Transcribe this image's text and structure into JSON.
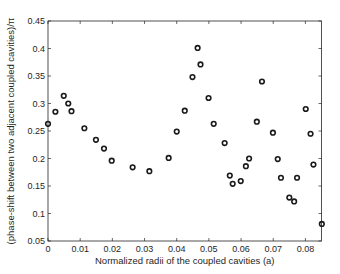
{
  "chart_data": {
    "type": "scatter",
    "title": "",
    "xlabel": "Normalized radii of the coupled cavities (a)",
    "ylabel": "(phase-shift between two adjacent coupled cavities)/π",
    "xlim": [
      0,
      0.085
    ],
    "ylim": [
      0.05,
      0.45
    ],
    "xticks": [
      0,
      0.01,
      0.02,
      0.03,
      0.04,
      0.05,
      0.06,
      0.07,
      0.08
    ],
    "xtick_labels": [
      "0",
      "0.01",
      "0.02",
      "0.03",
      "0.04",
      "0.05",
      "0.06",
      "0.07",
      "0.08"
    ],
    "yticks": [
      0.05,
      0.1,
      0.15,
      0.2,
      0.25,
      0.3,
      0.35,
      0.4,
      0.45
    ],
    "ytick_labels": [
      "0.05",
      "0.1",
      "0.15",
      "0.2",
      "0.25",
      "0.3",
      "0.35",
      "0.4",
      "0.45"
    ],
    "grid": false,
    "legend": null,
    "marker": "open-circle",
    "marker_color": "#1a1a1a",
    "series": [
      {
        "name": "phase-shift",
        "x": [
          0.0,
          0.0023,
          0.0049,
          0.0063,
          0.0073,
          0.0113,
          0.0149,
          0.0174,
          0.0198,
          0.0263,
          0.0315,
          0.0375,
          0.04,
          0.0425,
          0.0449,
          0.0465,
          0.0474,
          0.0499,
          0.0515,
          0.0549,
          0.0565,
          0.0574,
          0.0599,
          0.0615,
          0.0625,
          0.0649,
          0.0665,
          0.0699,
          0.0714,
          0.0724,
          0.075,
          0.0765,
          0.0774,
          0.0801,
          0.0816,
          0.0825,
          0.0851
        ],
        "y": [
          0.263,
          0.285,
          0.314,
          0.3,
          0.286,
          0.255,
          0.234,
          0.218,
          0.196,
          0.184,
          0.177,
          0.201,
          0.249,
          0.287,
          0.348,
          0.401,
          0.371,
          0.31,
          0.263,
          0.228,
          0.169,
          0.154,
          0.159,
          0.186,
          0.2,
          0.267,
          0.34,
          0.247,
          0.199,
          0.165,
          0.129,
          0.122,
          0.165,
          0.29,
          0.245,
          0.189,
          0.081
        ]
      }
    ]
  }
}
